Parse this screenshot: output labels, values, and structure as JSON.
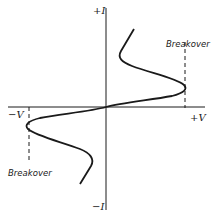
{
  "diagram": {
    "axes": {
      "y_positive_label": "+I",
      "y_negative_label": "−I",
      "x_positive_label": "+V",
      "x_negative_label": "−V"
    },
    "annotations": {
      "breakover_positive": "Breakover",
      "breakover_negative": "Breakover"
    },
    "colors": {
      "line": "#1a1a1a",
      "background": "#ffffff"
    }
  }
}
